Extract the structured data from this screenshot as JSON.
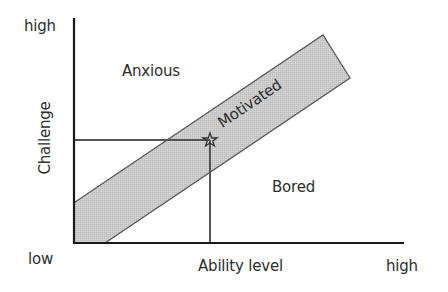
{
  "diagram": {
    "type": "flow-channel",
    "axes": {
      "x": {
        "title": "Ability level",
        "low_label": "low",
        "high_label": "high"
      },
      "y": {
        "title": "Challenge",
        "high_label": "high"
      }
    },
    "regions": {
      "above": "Anxious",
      "band": "Motivated",
      "below": "Bored"
    },
    "marker": {
      "shape": "star",
      "description": "current point on band with guide lines to both axes"
    },
    "colors": {
      "axis": "#1a1a1a",
      "band_fill": "#c9c9c9",
      "band_stroke": "#555555",
      "guide_line": "#555555",
      "text": "#2e2e2e"
    }
  }
}
